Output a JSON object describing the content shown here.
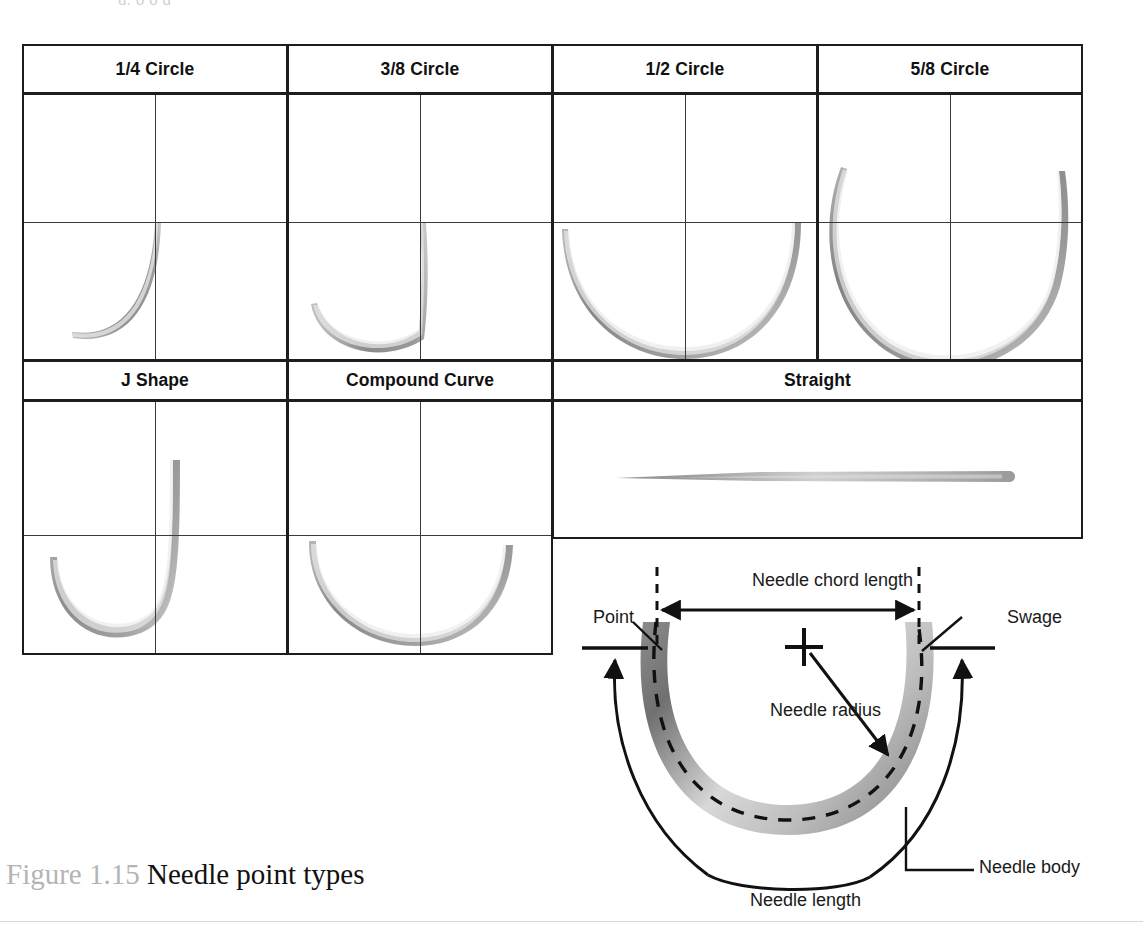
{
  "page": {
    "top_cut_text": "u, o        o     g",
    "caption_number": "Figure 1.15",
    "caption_title": "Needle point types"
  },
  "table": {
    "row1_headers": [
      "1/4 Circle",
      "3/8 Circle",
      "1/2 Circle",
      "5/8 Circle"
    ],
    "row2_headers": [
      "J Shape",
      "Compound Curve",
      "Straight"
    ],
    "needles": [
      {
        "name": "quarter-circle-needle",
        "arc_fraction": "1/4"
      },
      {
        "name": "three-eighths-circle-needle",
        "arc_fraction": "3/8"
      },
      {
        "name": "half-circle-needle",
        "arc_fraction": "1/2"
      },
      {
        "name": "five-eighths-circle-needle",
        "arc_fraction": "5/8"
      },
      {
        "name": "j-shape-needle",
        "arc_fraction": "J"
      },
      {
        "name": "compound-curve-needle",
        "arc_fraction": "compound"
      },
      {
        "name": "straight-needle",
        "arc_fraction": "straight"
      }
    ]
  },
  "diagram": {
    "labels": {
      "chord": "Needle chord  length",
      "point": "Point",
      "swage": "Swage",
      "radius": "Needle radius",
      "body": "Needle body",
      "length": "Needle length"
    }
  },
  "colors": {
    "border": "#1d1d1d",
    "guide_line": "#3b3b3b",
    "needle_dark": "#6e6e6e",
    "needle_mid": "#9b9b9b",
    "needle_light": "#e2e2e2",
    "caption_number": "#b4b4b4",
    "caption_title": "#111111",
    "ink": "#1a1a1a"
  }
}
